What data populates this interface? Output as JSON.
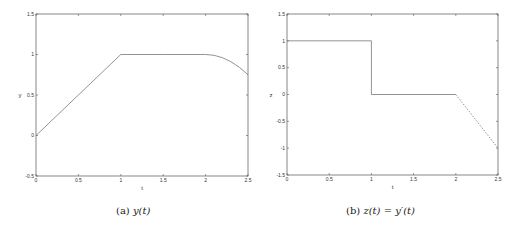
{
  "chart_data": [
    {
      "type": "line",
      "caption": "(a) y(t)",
      "title": "",
      "xlabel": "t",
      "ylabel": "y",
      "xlim": [
        0,
        2.5
      ],
      "ylim": [
        -0.5,
        1.5
      ],
      "xticks": [
        "0",
        "0.5",
        "1",
        "1.5",
        "2",
        "2.5"
      ],
      "yticks": [
        "-0.5",
        "0",
        "0.5",
        "1",
        "1.5"
      ],
      "grid": false,
      "series": [
        {
          "name": "y(t)",
          "style": "solid",
          "x": [
            0,
            0.5,
            1,
            1.5,
            2,
            2.1,
            2.2,
            2.3,
            2.4,
            2.5
          ],
          "y": [
            0,
            0.5,
            1,
            1,
            1,
            0.99,
            0.96,
            0.91,
            0.84,
            0.75
          ]
        }
      ]
    },
    {
      "type": "line",
      "caption": "(b) z(t) = y'(t)",
      "title": "",
      "xlabel": "t",
      "ylabel": "z",
      "xlim": [
        0,
        2.5
      ],
      "ylim": [
        -1.5,
        1.5
      ],
      "xticks": [
        "0",
        "0.5",
        "1",
        "1.5",
        "2",
        "2.5"
      ],
      "yticks": [
        "-1.5",
        "-1",
        "-0.5",
        "0",
        "0.5",
        "1",
        "1.5"
      ],
      "grid": false,
      "series": [
        {
          "name": "z(t) solid",
          "style": "solid",
          "x": [
            0,
            1,
            1,
            2
          ],
          "y": [
            1,
            1,
            0,
            0
          ]
        },
        {
          "name": "z(t) dashed",
          "style": "dashed",
          "x": [
            2,
            2.5
          ],
          "y": [
            0,
            -1
          ]
        }
      ]
    }
  ],
  "captions": {
    "a_label": "(a)",
    "a_expr": "y(t)",
    "b_label": "(b)",
    "b_expr": "z(t) = y′(t)"
  }
}
